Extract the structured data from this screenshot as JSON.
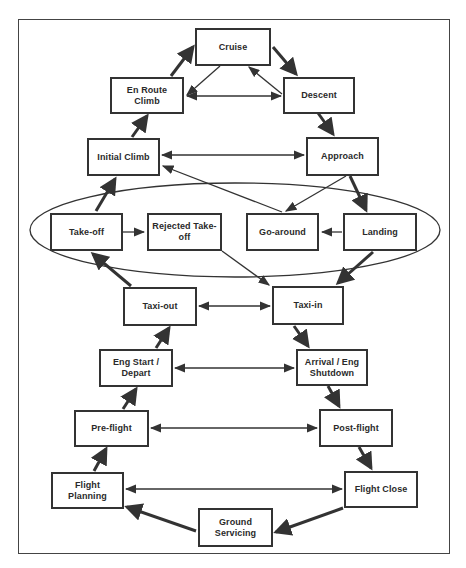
{
  "diagram": {
    "grouping": {
      "label": "Takeoff / landing phase group (ellipse)",
      "members": [
        "Take-off",
        "Rejected Take-off",
        "Go-around",
        "Landing"
      ]
    },
    "nodes": {
      "cruise": {
        "label": "Cruise"
      },
      "en_route_climb": {
        "label": "En Route Climb"
      },
      "descent": {
        "label": "Descent"
      },
      "initial_climb": {
        "label": "Initial Climb"
      },
      "approach": {
        "label": "Approach"
      },
      "take_off": {
        "label": "Take-off"
      },
      "rejected_take_off": {
        "label": "Rejected Take-\noff"
      },
      "go_around": {
        "label": "Go-around"
      },
      "landing": {
        "label": "Landing"
      },
      "taxi_out": {
        "label": "Taxi-out"
      },
      "taxi_in": {
        "label": "Taxi-in"
      },
      "eng_start_depart": {
        "label": "Eng Start /\nDepart"
      },
      "arrival_eng_shutdown": {
        "label": "Arrival / Eng\nShutdown"
      },
      "pre_flight": {
        "label": "Pre-flight"
      },
      "post_flight": {
        "label": "Post-flight"
      },
      "flight_planning": {
        "label": "Flight Planning"
      },
      "flight_close": {
        "label": "Flight Close"
      },
      "ground_servicing": {
        "label": "Ground\nServicing"
      }
    },
    "edges": [
      {
        "from": "Flight Planning",
        "to": "Pre-flight",
        "style": "thick"
      },
      {
        "from": "Pre-flight",
        "to": "Eng Start / Depart",
        "style": "thick"
      },
      {
        "from": "Eng Start / Depart",
        "to": "Taxi-out",
        "style": "thick"
      },
      {
        "from": "Taxi-out",
        "to": "Take-off",
        "style": "thick"
      },
      {
        "from": "Take-off",
        "to": "Initial Climb",
        "style": "thick"
      },
      {
        "from": "Initial Climb",
        "to": "En Route Climb",
        "style": "thick"
      },
      {
        "from": "En Route Climb",
        "to": "Cruise",
        "style": "thick"
      },
      {
        "from": "Cruise",
        "to": "Descent",
        "style": "thick"
      },
      {
        "from": "Descent",
        "to": "Approach",
        "style": "thick"
      },
      {
        "from": "Approach",
        "to": "Landing",
        "style": "thick"
      },
      {
        "from": "Landing",
        "to": "Taxi-in",
        "style": "thick"
      },
      {
        "from": "Taxi-in",
        "to": "Arrival / Eng Shutdown",
        "style": "thick"
      },
      {
        "from": "Arrival / Eng Shutdown",
        "to": "Post-flight",
        "style": "thick"
      },
      {
        "from": "Post-flight",
        "to": "Flight Close",
        "style": "thick"
      },
      {
        "from": "Flight Close",
        "to": "Ground Servicing",
        "style": "thick"
      },
      {
        "from": "Ground Servicing",
        "to": "Flight Planning",
        "style": "thick"
      },
      {
        "from": "Cruise",
        "to": "En Route Climb",
        "style": "thin"
      },
      {
        "from": "Descent",
        "to": "Cruise",
        "style": "thin"
      },
      {
        "from": "En Route Climb",
        "to": "Descent",
        "style": "thin-bidirectional"
      },
      {
        "from": "Initial Climb",
        "to": "Approach",
        "style": "thin-bidirectional"
      },
      {
        "from": "Go-around",
        "to": "Initial Climb",
        "style": "thin"
      },
      {
        "from": "Approach",
        "to": "Go-around",
        "style": "thin"
      },
      {
        "from": "Landing",
        "to": "Go-around",
        "style": "thin"
      },
      {
        "from": "Take-off",
        "to": "Rejected Take-off",
        "style": "thin"
      },
      {
        "from": "Rejected Take-off",
        "to": "Taxi-in",
        "style": "thin"
      },
      {
        "from": "Taxi-out",
        "to": "Taxi-in",
        "style": "thin-bidirectional"
      },
      {
        "from": "Eng Start / Depart",
        "to": "Arrival / Eng Shutdown",
        "style": "thin-bidirectional"
      },
      {
        "from": "Pre-flight",
        "to": "Post-flight",
        "style": "thin-bidirectional"
      },
      {
        "from": "Flight Planning",
        "to": "Flight Close",
        "style": "thin-bidirectional"
      }
    ],
    "colors": {
      "line": "#333333",
      "border": "#333333",
      "text": "#2a2a2a",
      "background": "#ffffff"
    }
  }
}
